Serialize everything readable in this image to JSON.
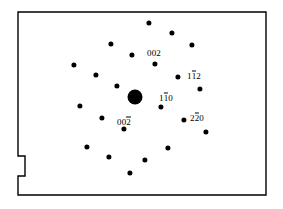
{
  "figure": {
    "kind": "electron-diffraction-pattern",
    "background_color": "#ffffff",
    "ink_color": "#000000",
    "plate": {
      "stroke_color": "#000000",
      "stroke_width": 1.4,
      "left": 18,
      "top": 12,
      "right": 266,
      "bottom": 195,
      "notch": {
        "present": true,
        "side": "left",
        "top_y": 156,
        "bottom_y": 176,
        "depth": 7
      }
    },
    "chart_data": {
      "type": "scatter",
      "title": "",
      "xlabel": "",
      "ylabel": "",
      "xlim": [
        18,
        266
      ],
      "ylim": [
        12,
        195
      ],
      "grid": false,
      "legend": "none",
      "note": "Single-crystal electron diffraction spot pattern; central transmitted beam is the largest spot. Coordinates are image pixels, y increasing downward.",
      "series": [
        {
          "name": "transmitted-beam",
          "points": [
            {
              "x": 135,
              "y": 97,
              "r": 7.5,
              "label": ""
            }
          ]
        },
        {
          "name": "diffraction-spots",
          "points": [
            {
              "x": 149,
              "y": 23,
              "r": 2.6,
              "label": ""
            },
            {
              "x": 172,
              "y": 33,
              "r": 2.6,
              "label": ""
            },
            {
              "x": 111,
              "y": 44,
              "r": 2.6,
              "label": ""
            },
            {
              "x": 192,
              "y": 45,
              "r": 2.6,
              "label": ""
            },
            {
              "x": 132,
              "y": 55,
              "r": 2.6,
              "label": ""
            },
            {
              "x": 155,
              "y": 64,
              "r": 2.6,
              "label": "002"
            },
            {
              "x": 74,
              "y": 65,
              "r": 2.6,
              "label": ""
            },
            {
              "x": 178,
              "y": 77,
              "r": 2.6,
              "label": "1̄2"
            },
            {
              "x": 96,
              "y": 75,
              "r": 2.6,
              "label": ""
            },
            {
              "x": 200,
              "y": 89,
              "r": 2.6,
              "label": ""
            },
            {
              "x": 117,
              "y": 86,
              "r": 2.6,
              "label": ""
            },
            {
              "x": 161,
              "y": 107,
              "r": 2.6,
              "label": "1̄0"
            },
            {
              "x": 80,
              "y": 106,
              "r": 2.6,
              "label": ""
            },
            {
              "x": 184,
              "y": 120,
              "r": 2.6,
              "label": "2̄2̄0"
            },
            {
              "x": 102,
              "y": 118,
              "r": 2.6,
              "label": ""
            },
            {
              "x": 206,
              "y": 132,
              "r": 2.6,
              "label": ""
            },
            {
              "x": 124,
              "y": 129,
              "r": 2.6,
              "label": "00̄2"
            },
            {
              "x": 168,
              "y": 148,
              "r": 2.6,
              "label": ""
            },
            {
              "x": 87,
              "y": 147,
              "r": 2.6,
              "label": ""
            },
            {
              "x": 145,
              "y": 160,
              "r": 2.6,
              "label": ""
            },
            {
              "x": 109,
              "y": 157,
              "r": 2.6,
              "label": ""
            },
            {
              "x": 130,
              "y": 173,
              "r": 2.6,
              "label": ""
            }
          ]
        }
      ]
    },
    "labels": [
      {
        "id": "label-002",
        "text_plain": "002",
        "parts": [
          {
            "t": "002",
            "bar": false
          }
        ],
        "x": 154,
        "y": 53
      },
      {
        "id": "label-1bar12",
        "text_plain": "1-12",
        "parts": [
          {
            "t": "1",
            "bar": false
          },
          {
            "t": "1",
            "bar": true
          },
          {
            "t": "2",
            "bar": false
          }
        ],
        "x": 194,
        "y": 76
      },
      {
        "id": "label-1bar10",
        "text_plain": "1-10",
        "parts": [
          {
            "t": "1",
            "bar": false
          },
          {
            "t": "1",
            "bar": true
          },
          {
            "t": "0",
            "bar": false
          }
        ],
        "x": 166,
        "y": 98
      },
      {
        "id": "label-2bar2bar0",
        "text_plain": "2-20",
        "parts": [
          {
            "t": "2",
            "bar": false
          },
          {
            "t": "2",
            "bar": true
          },
          {
            "t": "0",
            "bar": false
          }
        ],
        "x": 197,
        "y": 118
      },
      {
        "id": "label-00bar2",
        "text_plain": "00-2",
        "parts": [
          {
            "t": "00",
            "bar": false
          },
          {
            "t": "2",
            "bar": true
          }
        ],
        "x": 124,
        "y": 122
      }
    ]
  }
}
